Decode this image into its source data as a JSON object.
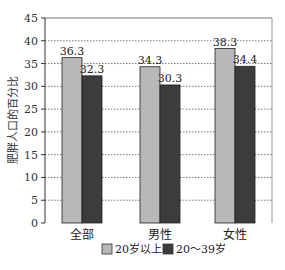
{
  "chart_data": {
    "type": "bar",
    "title": "",
    "xlabel": "",
    "ylabel": "肥胖人口的百分比",
    "ylim": [
      0,
      45
    ],
    "yticks": [
      0,
      5,
      10,
      15,
      20,
      25,
      30,
      35,
      40,
      45
    ],
    "grid": "horizontal dotted",
    "legend_position": "bottom",
    "categories": [
      "全部",
      "男性",
      "女性"
    ],
    "series": [
      {
        "name": "20岁以上",
        "color": "#b8b8b8",
        "values": [
          36.3,
          34.3,
          38.3
        ]
      },
      {
        "name": "20～39岁",
        "color": "#3c3c3c",
        "values": [
          32.3,
          30.3,
          34.4
        ]
      }
    ],
    "value_labels": [
      [
        "36.3",
        "34.3",
        "38.3"
      ],
      [
        "32.3",
        "30.3",
        "34.4"
      ]
    ]
  }
}
